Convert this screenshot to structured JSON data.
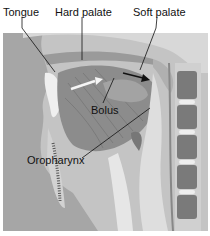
{
  "figure": {
    "type": "anatomical-illustration"
  },
  "labels": {
    "tongue": "Tongue",
    "hard_palate": "Hard palate",
    "soft_palate": "Soft palate",
    "bolus": "Bolus",
    "oropharynx": "Oropharynx"
  },
  "colors": {
    "background": "#bdbdbd",
    "face": "#9e9e9e",
    "tissue_light": "#e4e4e4",
    "tissue_mid": "#c8c8c8",
    "tongue": "#8a8a8a",
    "vertebra": "#7a7a7a",
    "line": "#111111"
  }
}
